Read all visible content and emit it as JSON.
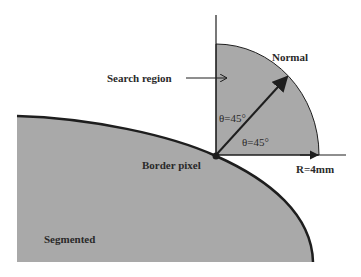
{
  "diagram": {
    "labels": {
      "normal": "Normal",
      "search_region": "Search region",
      "theta_upper": "θ=45°",
      "theta_lower": "θ=45°",
      "border_pixel": "Border pixel",
      "radius": "R=4mm",
      "segmented": "Segmented"
    },
    "colors": {
      "region_fill": "#a9a9a9",
      "line": "#1e1e1e",
      "background": "#ffffff"
    }
  }
}
